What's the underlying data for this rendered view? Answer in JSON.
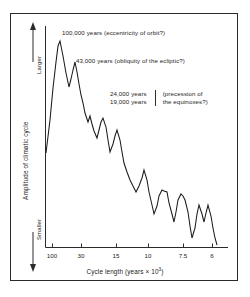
{
  "chart_data": {
    "type": "line",
    "title": "",
    "xlabel": "Cycle length (years × 10³)",
    "xlabel_base": "Cycle length (years × 10",
    "xlabel_exp": "3",
    "xlabel_close": ")",
    "ylabel": "Amplitude of climatic cycle",
    "y_axis_top_label": "Larger",
    "y_axis_bottom_label": "Smaller",
    "grid": false,
    "legend": "none",
    "x_ticks": [
      {
        "label": "100",
        "px": 52
      },
      {
        "label": "30",
        "px": 81
      },
      {
        "label": "15",
        "px": 116
      },
      {
        "label": "10",
        "px": 148
      },
      {
        "label": "7.5",
        "px": 183
      },
      {
        "label": "6",
        "px": 212
      }
    ],
    "ylim_labels": [
      "Smaller",
      "Larger"
    ],
    "series": [
      {
        "name": "Spectral power of climatic variation",
        "points": [
          [
            46,
            153
          ],
          [
            50,
            120
          ],
          [
            53,
            88
          ],
          [
            56,
            62
          ],
          [
            58,
            46
          ],
          [
            60,
            41
          ],
          [
            63,
            56
          ],
          [
            66,
            73
          ],
          [
            69,
            87
          ],
          [
            71,
            79
          ],
          [
            73,
            70
          ],
          [
            75,
            62
          ],
          [
            77,
            72
          ],
          [
            79,
            84
          ],
          [
            81,
            95
          ],
          [
            83,
            103
          ],
          [
            85,
            113
          ],
          [
            88,
            122
          ],
          [
            90,
            116
          ],
          [
            92,
            124
          ],
          [
            94,
            131
          ],
          [
            97,
            138
          ],
          [
            99,
            130
          ],
          [
            101,
            122
          ],
          [
            103,
            118
          ],
          [
            106,
            127
          ],
          [
            108,
            140
          ],
          [
            110,
            152
          ],
          [
            113,
            144
          ],
          [
            115,
            136
          ],
          [
            117,
            130
          ],
          [
            120,
            140
          ],
          [
            122,
            152
          ],
          [
            124,
            163
          ],
          [
            127,
            172
          ],
          [
            130,
            180
          ],
          [
            133,
            186
          ],
          [
            136,
            192
          ],
          [
            139,
            186
          ],
          [
            142,
            178
          ],
          [
            144,
            170
          ],
          [
            147,
            180
          ],
          [
            149,
            192
          ],
          [
            152,
            205
          ],
          [
            154,
            214
          ],
          [
            157,
            206
          ],
          [
            159,
            196
          ],
          [
            162,
            190
          ],
          [
            164,
            191
          ],
          [
            167,
            192
          ],
          [
            169,
            203
          ],
          [
            172,
            214
          ],
          [
            174,
            222
          ],
          [
            176,
            212
          ],
          [
            178,
            200
          ],
          [
            181,
            194
          ],
          [
            183,
            196
          ],
          [
            185,
            200
          ],
          [
            188,
            212
          ],
          [
            190,
            226
          ],
          [
            192,
            238
          ],
          [
            195,
            228
          ],
          [
            197,
            214
          ],
          [
            199,
            205
          ],
          [
            202,
            214
          ],
          [
            204,
            222
          ],
          [
            206,
            213
          ],
          [
            208,
            205
          ],
          [
            211,
            216
          ],
          [
            213,
            228
          ],
          [
            215,
            238
          ],
          [
            217,
            245
          ]
        ]
      }
    ],
    "annotations": [
      {
        "id": "annot-1",
        "text": "100,000 years (eccentricity of orbit?)",
        "refers_to": "eccentricity of orbit"
      },
      {
        "id": "annot-2",
        "text": "43,000 years (obliquity of the ecliptic?)",
        "refers_to": "obliquity of the ecliptic"
      },
      {
        "id": "annot-3",
        "line_1": "24,000 years",
        "line_2": "19,000 years",
        "bracket_line_1": "(precession of",
        "bracket_line_2": "the equinoxes?)",
        "refers_to": "precession of the equinoxes"
      }
    ],
    "colors": {
      "line": "#1a1a1a",
      "axis": "#2b2b2b",
      "frame": "#2b2b2b",
      "background": "#ffffff",
      "text": "#1c1c1c"
    }
  }
}
